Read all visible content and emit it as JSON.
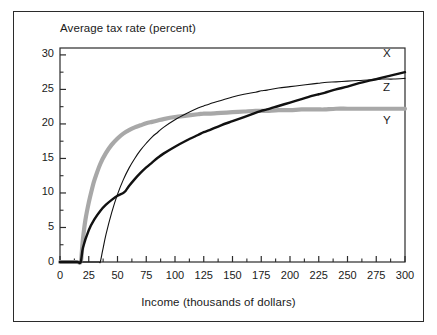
{
  "figure": {
    "title": "Average tax rate (percent)",
    "x_axis_title": "Income (thousands of dollars)"
  },
  "axes": {
    "y_ticks": [
      "0",
      "5",
      "10",
      "15",
      "20",
      "25",
      "30"
    ],
    "x_ticks": [
      "0",
      "25",
      "50",
      "75",
      "100",
      "125",
      "150",
      "175",
      "200",
      "225",
      "250",
      "275",
      "300"
    ]
  },
  "series_labels": {
    "x": "X",
    "z": "Z",
    "y": "Y"
  },
  "colors": {
    "axis": "#2b2b2b",
    "curve_x": "#111111",
    "curve_z": "#111111",
    "curve_y": "#a8a8a8",
    "frame": "#2b2b2b",
    "background": "#ffffff"
  },
  "chart_data": {
    "type": "line",
    "title": "Average tax rate (percent)",
    "xlabel": "Income (thousands of dollars)",
    "ylabel": "Average tax rate (percent)",
    "xlim": [
      0,
      300
    ],
    "ylim": [
      0,
      31
    ],
    "xticks": [
      0,
      25,
      50,
      75,
      100,
      125,
      150,
      175,
      200,
      225,
      250,
      275,
      300
    ],
    "yticks": [
      0,
      5,
      10,
      15,
      20,
      25,
      30
    ],
    "minor_xtick_step": 12.5,
    "minor_ytick_step": 2.5,
    "grid": false,
    "legend": "inline labels at right end of each curve",
    "series": [
      {
        "name": "X",
        "style": "thick black line",
        "x": [
          0,
          5,
          10,
          15,
          18,
          20,
          25,
          30,
          35,
          40,
          45,
          50,
          55,
          57,
          60,
          65,
          70,
          75,
          80,
          85,
          90,
          100,
          110,
          120,
          125,
          130,
          140,
          150,
          160,
          170,
          175,
          180,
          190,
          200,
          210,
          220,
          225,
          230,
          240,
          250,
          260,
          270,
          275,
          280,
          290,
          300
        ],
        "y": [
          0,
          0,
          0,
          0,
          0,
          2.1,
          4.6,
          6.2,
          7.4,
          8.3,
          9.0,
          9.6,
          10.0,
          10.3,
          11.0,
          12.0,
          12.9,
          13.7,
          14.4,
          15.1,
          15.7,
          16.7,
          17.6,
          18.4,
          18.8,
          19.1,
          19.8,
          20.4,
          21.0,
          21.6,
          21.9,
          22.1,
          22.6,
          23.1,
          23.6,
          24.1,
          24.3,
          24.5,
          25.0,
          25.4,
          25.9,
          26.3,
          26.5,
          26.7,
          27.1,
          27.5
        ]
      },
      {
        "name": "Z",
        "style": "thin black line",
        "x": [
          0,
          5,
          10,
          15,
          20,
          25,
          30,
          34,
          35,
          37,
          40,
          45,
          50,
          55,
          60,
          65,
          70,
          75,
          80,
          85,
          90,
          100,
          110,
          120,
          125,
          130,
          140,
          150,
          160,
          170,
          175,
          180,
          190,
          200,
          210,
          220,
          225,
          230,
          240,
          250,
          260,
          270,
          275,
          280,
          290,
          300
        ],
        "y": [
          0,
          0,
          0,
          0,
          0,
          0,
          0,
          0,
          0,
          1.6,
          4.0,
          7.2,
          9.8,
          11.9,
          13.6,
          15.0,
          16.2,
          17.2,
          18.1,
          18.8,
          19.5,
          20.6,
          21.5,
          22.3,
          22.6,
          22.9,
          23.4,
          23.9,
          24.3,
          24.6,
          24.8,
          24.9,
          25.2,
          25.4,
          25.6,
          25.8,
          25.9,
          26.0,
          26.1,
          26.2,
          26.3,
          26.4,
          26.4,
          26.5,
          26.5,
          26.6
        ]
      },
      {
        "name": "Y",
        "style": "thick gray line",
        "x": [
          0,
          5,
          10,
          15,
          18,
          19,
          20,
          22,
          25,
          28,
          30,
          35,
          40,
          45,
          50,
          55,
          60,
          65,
          70,
          75,
          80,
          85,
          90,
          100,
          110,
          120,
          125,
          130,
          140,
          150,
          160,
          170,
          175,
          180,
          190,
          200,
          210,
          220,
          225,
          230,
          240,
          250,
          260,
          270,
          275,
          280,
          290,
          300
        ],
        "y": [
          0,
          0,
          0,
          0,
          0,
          1.5,
          3.4,
          6.0,
          8.6,
          10.7,
          11.9,
          14.2,
          15.8,
          17.0,
          17.9,
          18.6,
          19.1,
          19.5,
          19.8,
          20.1,
          20.3,
          20.5,
          20.7,
          21.0,
          21.2,
          21.4,
          21.5,
          21.5,
          21.6,
          21.7,
          21.8,
          21.9,
          21.9,
          21.9,
          22.0,
          22.0,
          22.1,
          22.1,
          22.1,
          22.1,
          22.2,
          22.2,
          22.2,
          22.2,
          22.2,
          22.2,
          22.2,
          22.2
        ]
      }
    ],
    "annotations": [
      {
        "text": "X",
        "x": 300,
        "y": 30.0
      },
      {
        "text": "Z",
        "x": 300,
        "y": 25.0
      },
      {
        "text": "Y",
        "x": 300,
        "y": 20.3
      }
    ]
  }
}
